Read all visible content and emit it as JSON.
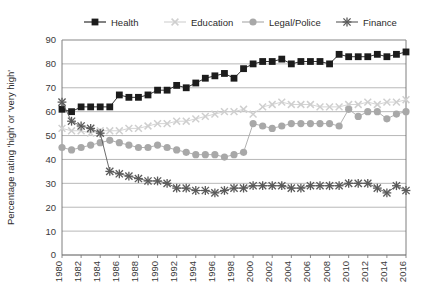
{
  "chart_data": {
    "type": "line",
    "title": "",
    "xlabel": "",
    "ylabel": "Percentage rating 'high' or 'very high'",
    "ylim": [
      0,
      90
    ],
    "ytick_step": 10,
    "yticks": [
      0,
      10,
      20,
      30,
      40,
      50,
      60,
      70,
      80,
      90
    ],
    "grid": true,
    "legend_position": "top",
    "x": [
      1980,
      1981,
      1982,
      1983,
      1984,
      1985,
      1986,
      1987,
      1988,
      1989,
      1990,
      1991,
      1992,
      1993,
      1994,
      1995,
      1996,
      1997,
      1998,
      1999,
      2000,
      2001,
      2002,
      2003,
      2004,
      2005,
      2006,
      2007,
      2008,
      2009,
      2010,
      2011,
      2012,
      2013,
      2014,
      2015,
      2016
    ],
    "xtick_labels": [
      "1980",
      "1982",
      "1984",
      "1986",
      "1988",
      "1990",
      "1992",
      "1994",
      "1996",
      "1998",
      "2000",
      "2002",
      "2004",
      "2006",
      "2008",
      "2010",
      "2012",
      "2014",
      "2016"
    ],
    "series": [
      {
        "name": "Health",
        "marker": "filled-square",
        "color": "#1c1c1c",
        "values": [
          61,
          60,
          62,
          62,
          62,
          62,
          67,
          66,
          66,
          67,
          69,
          69,
          71,
          70,
          72,
          74,
          75,
          76,
          74,
          78,
          80,
          81,
          81,
          82,
          80,
          81,
          81,
          81,
          80,
          84,
          83,
          83,
          83,
          84,
          83,
          84,
          85
        ]
      },
      {
        "name": "Education",
        "marker": "cross-x",
        "color": "#cfcfcf",
        "values": [
          53,
          52,
          52,
          51,
          52,
          52,
          52,
          53,
          53,
          54,
          55,
          55,
          56,
          56,
          57,
          58,
          59,
          60,
          60,
          61,
          59,
          62,
          63,
          64,
          63,
          63,
          63,
          62,
          62,
          62,
          63,
          63,
          64,
          63,
          64,
          64,
          65
        ]
      },
      {
        "name": "Legal/Police",
        "marker": "filled-circle",
        "color": "#a8a8a8",
        "values": [
          45,
          44,
          45,
          46,
          47,
          48,
          47,
          46,
          45,
          45,
          46,
          45,
          44,
          43,
          42,
          42,
          42,
          41,
          42,
          43,
          55,
          54,
          53,
          54,
          55,
          55,
          55,
          55,
          55,
          54,
          61,
          58,
          60,
          60,
          57,
          59,
          60
        ]
      },
      {
        "name": "Finance",
        "marker": "star-x",
        "color": "#5a5a5a",
        "values": [
          64,
          56,
          54,
          53,
          51,
          35,
          34,
          33,
          32,
          31,
          31,
          30,
          28,
          28,
          27,
          27,
          26,
          27,
          28,
          28,
          29,
          29,
          29,
          29,
          28,
          28,
          29,
          29,
          29,
          29,
          30,
          30,
          30,
          28,
          26,
          29,
          27
        ]
      }
    ]
  },
  "legend": {
    "items": [
      {
        "label": "Health",
        "marker_name": "legend-marker-square"
      },
      {
        "label": "Education",
        "marker_name": "legend-marker-cross"
      },
      {
        "label": "Legal/Police",
        "marker_name": "legend-marker-circle"
      },
      {
        "label": "Finance",
        "marker_name": "legend-marker-star"
      }
    ]
  },
  "colors": {
    "health": "#1c1c1c",
    "education": "#cfcfcf",
    "legal_police": "#a8a8a8",
    "finance": "#5a5a5a",
    "gridline": "#9a9a9a",
    "axis": "#6f6f6f",
    "text": "#2b2b2b"
  }
}
